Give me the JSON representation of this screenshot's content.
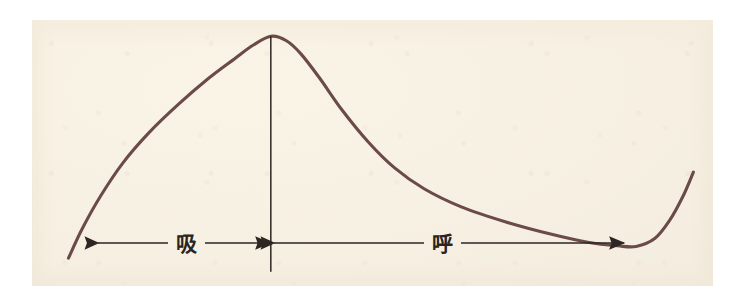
{
  "figure": {
    "kind": "line-chart",
    "description_visible_text": [],
    "paper_background_color": "#f7f1e3",
    "page_background_color": "#ffffff",
    "curve_color": "#6b4a48",
    "axis_color": "#2d2622",
    "label_color": "#2a2320"
  },
  "labels": {
    "inhale": "吸",
    "exhale": "呼"
  },
  "chart_data": {
    "type": "line",
    "title": "",
    "xlabel": "",
    "ylabel": "",
    "grid": false,
    "legend": "none",
    "xlim": [
      0,
      100
    ],
    "ylim": [
      0,
      100
    ],
    "annotations": [
      {
        "name": "inhale-span",
        "label": "吸",
        "arrow": "double-headed",
        "x_start_pct": 9.5,
        "x_end_pct": 36.4,
        "y_pct": 19.6
      },
      {
        "name": "exhale-span",
        "label": "呼",
        "arrow": "double-headed",
        "x_start_pct": 36.4,
        "x_end_pct": 84.0,
        "y_pct": 19.6
      },
      {
        "name": "peak-marker",
        "label": "",
        "type": "vertical-line",
        "x_pct": 36.4,
        "y_top_pct": 88.0,
        "y_bottom_pct": 10.0
      }
    ],
    "series": [
      {
        "name": "respiratory flow",
        "points_pct": [
          {
            "x": 9.2,
            "y": 14.5
          },
          {
            "x": 11.0,
            "y": 24.0
          },
          {
            "x": 13.5,
            "y": 35.0
          },
          {
            "x": 16.5,
            "y": 46.0
          },
          {
            "x": 20.0,
            "y": 56.0
          },
          {
            "x": 24.0,
            "y": 65.5
          },
          {
            "x": 28.0,
            "y": 74.0
          },
          {
            "x": 31.5,
            "y": 80.5
          },
          {
            "x": 34.0,
            "y": 85.0
          },
          {
            "x": 36.4,
            "y": 88.0
          },
          {
            "x": 38.5,
            "y": 86.5
          },
          {
            "x": 40.5,
            "y": 82.0
          },
          {
            "x": 43.0,
            "y": 74.0
          },
          {
            "x": 46.0,
            "y": 63.5
          },
          {
            "x": 49.5,
            "y": 53.0
          },
          {
            "x": 53.0,
            "y": 44.5
          },
          {
            "x": 57.0,
            "y": 37.5
          },
          {
            "x": 62.0,
            "y": 31.5
          },
          {
            "x": 68.0,
            "y": 26.5
          },
          {
            "x": 74.0,
            "y": 22.5
          },
          {
            "x": 79.0,
            "y": 19.8
          },
          {
            "x": 83.0,
            "y": 18.6
          },
          {
            "x": 85.5,
            "y": 18.4
          },
          {
            "x": 88.0,
            "y": 21.0
          },
          {
            "x": 90.0,
            "y": 27.0
          },
          {
            "x": 91.8,
            "y": 35.0
          },
          {
            "x": 93.2,
            "y": 43.0
          }
        ]
      }
    ]
  }
}
